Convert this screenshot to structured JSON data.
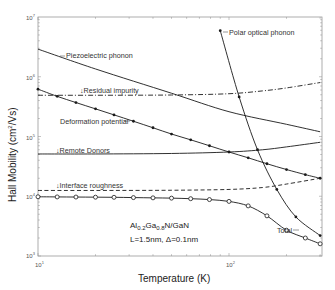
{
  "chart_data": {
    "type": "line",
    "title": "",
    "xlabel": "Temperature  (K)",
    "ylabel": "Hall Mobility  (cm²/Vs)",
    "xscale": "log",
    "yscale": "log",
    "xlim": [
      10,
      300
    ],
    "ylim": [
      1000,
      10000000
    ],
    "x_tick_labels": [
      "10^1",
      "10^2"
    ],
    "y_tick_labels": [
      "10^3",
      "10^4",
      "10^5",
      "10^6",
      "10^7"
    ],
    "grid": false,
    "legend": "inline labels",
    "annotations": [
      "Al0.2Ga0.8N/GaN",
      "L=1.5nm, Δ=0.1nm"
    ],
    "series": [
      {
        "name": "Piezoelectric phonon",
        "style": "solid",
        "marker": "none",
        "x": [
          10,
          20,
          50,
          100,
          200,
          300
        ],
        "y": [
          2900000,
          1350000,
          530000,
          260000,
          160000,
          120000
        ]
      },
      {
        "name": "Residual impurity",
        "style": "dashdot",
        "marker": "none",
        "x": [
          10,
          20,
          50,
          100,
          150,
          200,
          300
        ],
        "y": [
          490000,
          490000,
          495000,
          520000,
          580000,
          650000,
          800000
        ]
      },
      {
        "name": "Deformation potential",
        "style": "solid",
        "marker": "dot",
        "x": [
          10,
          12.6,
          15.8,
          20,
          25,
          31.6,
          40,
          50,
          63,
          79,
          100,
          126,
          158,
          200,
          251,
          300
        ],
        "y": [
          620000,
          470000,
          370000,
          290000,
          230000,
          180000,
          140000,
          110000,
          88000,
          70000,
          55000,
          44000,
          35000,
          28000,
          23000,
          20000
        ]
      },
      {
        "name": "Remote Donors",
        "style": "solid",
        "marker": "none",
        "x": [
          10,
          20,
          50,
          100,
          150,
          200,
          300
        ],
        "y": [
          51000,
          51000,
          52000,
          55000,
          60000,
          67000,
          80000
        ]
      },
      {
        "name": "Interface roughness",
        "style": "dashed",
        "marker": "none",
        "x": [
          10,
          20,
          50,
          100,
          150,
          200,
          300
        ],
        "y": [
          12500,
          12500,
          12600,
          13000,
          14000,
          16000,
          20000
        ]
      },
      {
        "name": "Polar optical phonon",
        "style": "solid",
        "marker": "dot",
        "x": [
          90,
          113,
          141,
          178,
          224,
          300
        ],
        "y": [
          5900000,
          460000,
          60000,
          13000,
          4500,
          2200
        ]
      },
      {
        "name": "Total",
        "style": "solid",
        "marker": "circle",
        "x": [
          10,
          12.6,
          15.8,
          20,
          25,
          31.6,
          40,
          50,
          63,
          79,
          100,
          126,
          158,
          200,
          251,
          300
        ],
        "y": [
          9800,
          9750,
          9700,
          9650,
          9600,
          9500,
          9400,
          9300,
          9100,
          8800,
          8200,
          6900,
          4700,
          2700,
          2000,
          1600
        ]
      }
    ]
  },
  "labels": {
    "piezo": "Piezoelectric phonon",
    "residual": "↓Residual impurity",
    "deformation": "Deformation potential",
    "remote": "↓Remote Donors",
    "interface": "↓Interface roughness",
    "polar": "Polar optical phonon",
    "total": "Total",
    "material_a": "Al",
    "material_sub1": "0.2",
    "material_b": "Ga",
    "material_sub2": "0.8",
    "material_c": "N/GaN",
    "params": "L=1.5nm, Δ=0.1nm",
    "xlabel": "Temperature  (K)",
    "ylabel_a": "Hall Mobility  (cm",
    "ylabel_sup": "2",
    "ylabel_b": "/Vs)",
    "xt1_base": "10",
    "xt1_exp": "1",
    "xt2_base": "10",
    "xt2_exp": "2",
    "yt3_exp": "3",
    "yt4_exp": "4",
    "yt5_exp": "5",
    "yt6_exp": "6",
    "yt7_exp": "7",
    "yt_base": "10"
  }
}
